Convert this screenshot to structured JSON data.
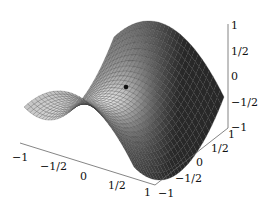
{
  "chart_data": {
    "type": "surface3d",
    "title": "",
    "function": "z = x^2 - y^2 (saddle)",
    "xlabel": "",
    "ylabel": "",
    "zlabel": "",
    "x_range": [
      -1,
      1
    ],
    "y_range": [
      -1,
      1
    ],
    "z_range": [
      -1,
      1
    ],
    "x_ticks": [
      "−1",
      "−1/2",
      "0",
      "1/2",
      "1"
    ],
    "y_ticks": [
      "−1",
      "−1/2",
      "0",
      "1/2",
      "1"
    ],
    "z_ticks": [
      "1",
      "1/2",
      "0",
      "−1/2",
      "−1"
    ],
    "grid_resolution": 30,
    "saddle_point": {
      "x": 0,
      "y": 0,
      "z": 0,
      "marker": "dot"
    },
    "shading": "grayscale",
    "mesh_color": "#333333"
  }
}
